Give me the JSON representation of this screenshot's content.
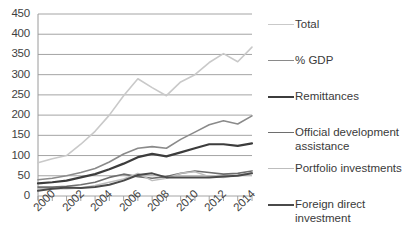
{
  "chart_data": {
    "type": "line",
    "title": "",
    "xlabel": "",
    "ylabel": "",
    "grid": true,
    "legend_position": "right",
    "xlim": [
      2000,
      2015
    ],
    "ylim": [
      0,
      450
    ],
    "y_ticks": [
      0,
      50,
      100,
      150,
      200,
      250,
      300,
      350,
      400,
      450
    ],
    "x_tick_labels": [
      "2000",
      "2002",
      "2004",
      "2006",
      "2008",
      "2010",
      "2012",
      "2014"
    ],
    "x": [
      2000,
      2001,
      2002,
      2003,
      2004,
      2005,
      2006,
      2007,
      2008,
      2009,
      2010,
      2011,
      2012,
      2013,
      2014,
      2015
    ],
    "series": [
      {
        "name": "Total",
        "color": "#c9c9c9",
        "width": 1.6,
        "values": [
          82,
          92,
          100,
          128,
          160,
          200,
          248,
          290,
          268,
          248,
          282,
          300,
          330,
          352,
          332,
          368
        ]
      },
      {
        "name": "% GDP",
        "color": "#8a8a8a",
        "width": 1.6,
        "values": [
          40,
          44,
          50,
          58,
          68,
          84,
          104,
          118,
          122,
          118,
          140,
          158,
          176,
          186,
          178,
          198
        ]
      },
      {
        "name": "Remittances",
        "color": "#3c3c3c",
        "width": 2.2,
        "values": [
          31,
          34,
          38,
          46,
          54,
          66,
          80,
          96,
          104,
          98,
          108,
          118,
          128,
          128,
          124,
          130
        ]
      },
      {
        "name": "Official development assistance",
        "color": "#6e6e6e",
        "width": 1.6,
        "values": [
          22,
          22,
          24,
          28,
          34,
          46,
          54,
          48,
          44,
          48,
          56,
          62,
          58,
          54,
          56,
          62
        ]
      },
      {
        "name": "Portfolio investments",
        "color": "#bdbdbd",
        "width": 1.5,
        "values": [
          18,
          18,
          18,
          20,
          26,
          34,
          42,
          56,
          38,
          44,
          56,
          60,
          48,
          46,
          52,
          58
        ]
      },
      {
        "name": "Foreign direct investment",
        "color": "#4a4a4a",
        "width": 2.0,
        "values": [
          13,
          18,
          21,
          20,
          22,
          28,
          38,
          52,
          56,
          46,
          46,
          46,
          46,
          48,
          50,
          56
        ]
      }
    ]
  },
  "axis": {
    "y_tick_labels": [
      "450",
      "400",
      "350",
      "300",
      "250",
      "200",
      "150",
      "100",
      "50",
      "0"
    ],
    "x_tick_labels": [
      "2000",
      "2002",
      "2004",
      "2006",
      "2008",
      "2010",
      "2012",
      "2014"
    ]
  },
  "legend": {
    "items": [
      {
        "label": "Total",
        "color": "#c9c9c9",
        "width": 1.6
      },
      {
        "label": "% GDP",
        "color": "#8a8a8a",
        "width": 1.8
      },
      {
        "label": "Remittances",
        "color": "#3c3c3c",
        "width": 2.6
      },
      {
        "label": "Official development assistance",
        "color": "#6e6e6e",
        "width": 1.8
      },
      {
        "label": "Portfolio investments",
        "color": "#bdbdbd",
        "width": 1.6
      },
      {
        "label": "Foreign direct investment",
        "color": "#4a4a4a",
        "width": 2.4
      }
    ]
  },
  "style": {
    "gridline_color": "#9a9a9a",
    "axis_color": "#9a9a9a",
    "text_color": "#3a3a3a",
    "background": "#ffffff"
  }
}
